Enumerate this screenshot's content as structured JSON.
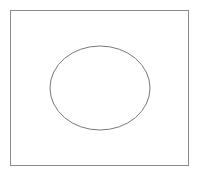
{
  "diagram": {
    "frame": {
      "x": 10,
      "y": 10,
      "width": 179,
      "height": 156,
      "stroke": "#8a8a8a"
    },
    "ellipse": {
      "cx": 100,
      "cy": 88,
      "rx": 50,
      "ry": 42,
      "stroke": "#7a7a7a",
      "fill": "none"
    },
    "background": "#ffffff"
  }
}
